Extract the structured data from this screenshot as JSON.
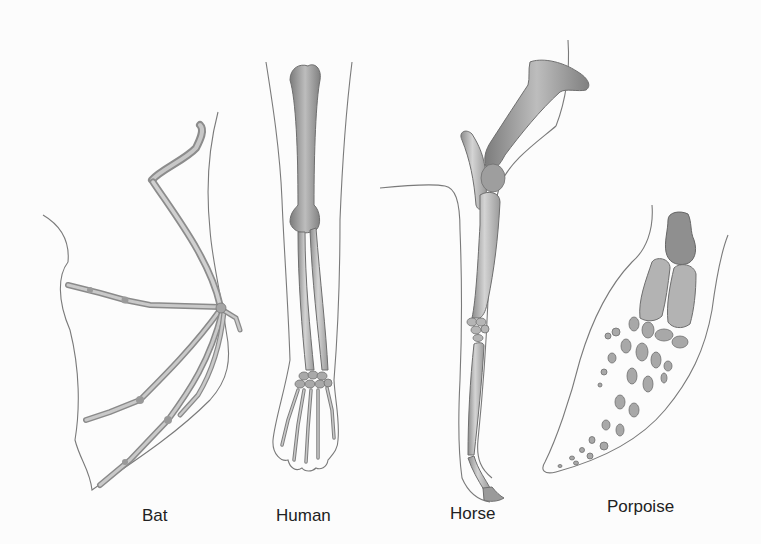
{
  "figure": {
    "background": "#fcfcfc",
    "bone_color": "#b9b9b9",
    "bone_shadow": "#8a8a8a",
    "outline_color": "#7a7a7a"
  },
  "limbs": [
    {
      "id": "bat",
      "label": "Bat",
      "label_x": 142,
      "label_y": 522
    },
    {
      "id": "human",
      "label": "Human",
      "label_x": 276,
      "label_y": 522
    },
    {
      "id": "horse",
      "label": "Horse",
      "label_x": 450,
      "label_y": 520
    },
    {
      "id": "porpoise",
      "label": "Porpoise",
      "label_x": 607,
      "label_y": 513
    }
  ]
}
